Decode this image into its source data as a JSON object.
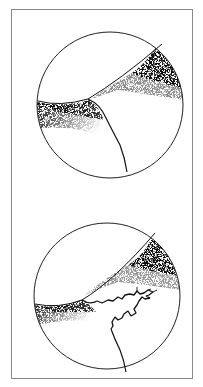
{
  "figure": {
    "panels": [
      {
        "id": "top",
        "feature": "boundary with single branching line"
      },
      {
        "id": "bottom",
        "feature": "boundary with branching line and jagged crack"
      }
    ],
    "colors": {
      "ink": "#1a1a1a",
      "frame": "#888888",
      "background": "#ffffff"
    }
  }
}
